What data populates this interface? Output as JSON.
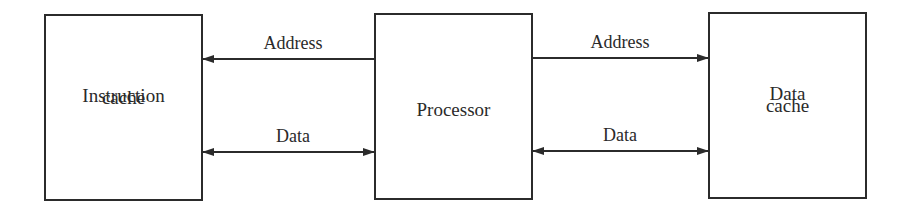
{
  "diagram": {
    "nodes": [
      {
        "id": "icache",
        "lines": [
          "Instruction",
          "cache"
        ]
      },
      {
        "id": "proc",
        "lines": [
          "Processor"
        ]
      },
      {
        "id": "dcache",
        "lines": [
          "Data",
          "cache"
        ]
      }
    ],
    "edges": [
      {
        "from": "proc",
        "to": "icache",
        "label": "Address",
        "direction": "one-way"
      },
      {
        "from": "proc",
        "to": "icache",
        "label": "Data",
        "direction": "bidirectional"
      },
      {
        "from": "proc",
        "to": "dcache",
        "label": "Address",
        "direction": "one-way"
      },
      {
        "from": "proc",
        "to": "dcache",
        "label": "Data",
        "direction": "bidirectional"
      }
    ],
    "colors": {
      "stroke": "#2b2b2b",
      "background": "#ffffff"
    }
  }
}
